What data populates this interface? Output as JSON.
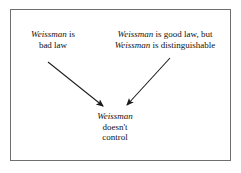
{
  "figure": {
    "type": "argument-flow-diagram",
    "frame_border_color": "#6f6f6f",
    "background_color": "#ffffff",
    "text_color": "#111111",
    "arrow_color": "#1a1a1a"
  },
  "nodes": {
    "left_premise": {
      "name": "bad-law-premise",
      "line1_emphasis": "Weissman",
      "line1_rest": " is",
      "line2": "bad law"
    },
    "right_premise": {
      "name": "good-law-premise",
      "line1_emphasis": "Weissman",
      "line1_rest": " is good law, but",
      "line2_emphasis": "Weissman",
      "line2_rest": " is distinguishable"
    },
    "conclusion": {
      "name": "conclusion",
      "line1_emphasis": "Weissman",
      "line2": "doesn't",
      "line3": "control"
    }
  },
  "arrows": [
    {
      "name": "arrow-left-premise-to-conclusion",
      "from_label": "Weissman is bad law",
      "to_label": "Weissman doesn't control",
      "x1": 48,
      "y1": 62,
      "x2": 106,
      "y2": 108,
      "direction": "down-right"
    },
    {
      "name": "arrow-right-premise-to-conclusion",
      "from_label": "Weissman is good law, but Weissman is distinguishable",
      "to_label": "Weissman doesn't control",
      "x1": 170,
      "y1": 58,
      "x2": 124,
      "y2": 108,
      "direction": "down-left"
    }
  ]
}
